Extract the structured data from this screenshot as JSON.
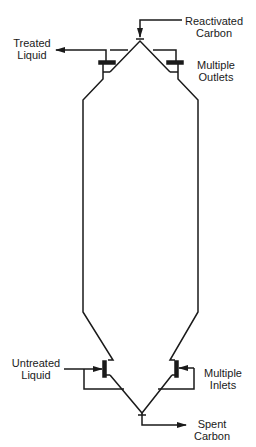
{
  "diagram": {
    "type": "process-vessel",
    "line_color": "#1a1a1a",
    "background": "#ffffff"
  },
  "labels": {
    "reactivated_carbon": {
      "line1": "Reactivated",
      "line2": "Carbon"
    },
    "treated_liquid": {
      "line1": "Treated",
      "line2": "Liquid"
    },
    "multiple_outlets": {
      "line1": "Multiple",
      "line2": "Outlets"
    },
    "untreated_liquid": {
      "line1": "Untreated",
      "line2": "Liquid"
    },
    "multiple_inlets": {
      "line1": "Multiple",
      "line2": "Inlets"
    },
    "spent_carbon": {
      "line1": "Spent",
      "line2": "Carbon"
    }
  },
  "flows": [
    {
      "name": "Reactivated Carbon",
      "direction": "in",
      "location": "top apex"
    },
    {
      "name": "Treated Liquid",
      "direction": "out",
      "location": "top outlets"
    },
    {
      "name": "Untreated Liquid",
      "direction": "in",
      "location": "bottom inlets"
    },
    {
      "name": "Spent Carbon",
      "direction": "out",
      "location": "bottom apex"
    }
  ]
}
